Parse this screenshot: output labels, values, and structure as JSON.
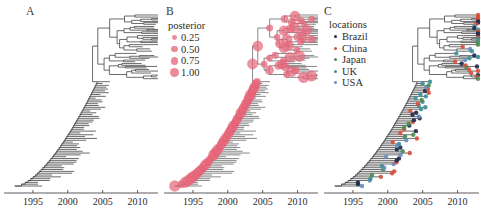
{
  "figure": {
    "background": "#ffffff",
    "width": 481,
    "height": 219,
    "axis_color": "#4a4a4a",
    "branch_color": "#3a3a3a"
  },
  "chart_data": {
    "type": "line",
    "title": "",
    "subtitle": "",
    "xlabel": "",
    "ylabel": "",
    "grid": false,
    "xlim": [
      1992.0,
      2012.5
    ],
    "xticks": [
      1995,
      2000,
      2005,
      2010
    ],
    "xtick_labels": [
      "1995",
      "2000",
      "2005",
      "2010"
    ],
    "panels": [
      {
        "label": "A",
        "description": "Time-scaled phylogenetic tree, plain branches, no node annotation",
        "node_annotation": "none",
        "tip_count": 95,
        "root_year": 1992.4,
        "newest_tip_year": 2012.0
      },
      {
        "label": "B",
        "description": "Same tree with internal nodes scaled by posterior support probability",
        "node_annotation": "posterior-circles",
        "node_color": "#e8697d",
        "tip_count": 95,
        "root_year": 1992.4,
        "newest_tip_year": 2012.0
      },
      {
        "label": "C",
        "description": "Same tree with tips colored by sampling location",
        "node_annotation": "location-tip-dots",
        "tip_count": 95,
        "root_year": 1992.4,
        "newest_tip_year": 2012.0
      }
    ],
    "legends": [
      {
        "panel": "B",
        "title": "posterior",
        "type": "size",
        "color": "#e8697d",
        "entries": [
          {
            "label": "0.25",
            "value": 0.25,
            "radius": 2.4
          },
          {
            "label": "0.50",
            "value": 0.5,
            "radius": 3.1
          },
          {
            "label": "0.75",
            "value": 0.75,
            "radius": 3.8
          },
          {
            "label": "1.00",
            "value": 1.0,
            "radius": 4.6
          }
        ]
      },
      {
        "panel": "C",
        "title": "locations",
        "type": "color",
        "entries": [
          {
            "label": "Brazil",
            "color": "#1f2d4d"
          },
          {
            "label": "China",
            "color": "#d94f3d"
          },
          {
            "label": "Japan",
            "color": "#4d8c52"
          },
          {
            "label": "UK",
            "color": "#3f8f96"
          },
          {
            "label": "USA",
            "color": "#6a8fbf"
          }
        ]
      }
    ]
  },
  "panel_a": {
    "label": "A"
  },
  "panel_b": {
    "label": "B",
    "legend_title": "posterior",
    "legend_items": [
      "0.25",
      "0.50",
      "0.75",
      "1.00"
    ]
  },
  "panel_c": {
    "label": "C",
    "legend_title": "locations",
    "legend_items": [
      "Brazil",
      "China",
      "Japan",
      "UK",
      "USA"
    ]
  },
  "axis": {
    "ticks": [
      "1995",
      "2000",
      "2005",
      "2010"
    ]
  }
}
